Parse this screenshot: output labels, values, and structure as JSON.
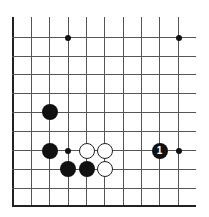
{
  "board": {
    "grid": {
      "x_lines": [
        12.5,
        31,
        49,
        67.5,
        86,
        104,
        122.5,
        141,
        159,
        178
      ],
      "y_lines": [
        37,
        55.5,
        74,
        93,
        111.5,
        130.5,
        150,
        168.5,
        188,
        206
      ],
      "top_edge": 17,
      "right_extent": 196,
      "left_border": true,
      "bottom_border": true
    },
    "hoshi": [
      {
        "col": 3,
        "row": 0
      },
      {
        "col": 9,
        "row": 0
      },
      {
        "col": 3,
        "row": 6
      },
      {
        "col": 9,
        "row": 6
      }
    ],
    "stones": [
      {
        "color": "black",
        "col": 2,
        "row": 4,
        "label": ""
      },
      {
        "color": "black",
        "col": 2,
        "row": 6,
        "label": ""
      },
      {
        "color": "white",
        "col": 4,
        "row": 6,
        "label": ""
      },
      {
        "color": "white",
        "col": 5,
        "row": 6,
        "label": ""
      },
      {
        "color": "black",
        "col": 3,
        "row": 7,
        "label": ""
      },
      {
        "color": "black",
        "col": 4,
        "row": 7,
        "label": ""
      },
      {
        "color": "white",
        "col": 5,
        "row": 7,
        "label": ""
      },
      {
        "color": "black",
        "col": 8,
        "row": 6,
        "label": "1"
      }
    ],
    "stone_diameter": 16,
    "hoshi_diameter": 6
  }
}
